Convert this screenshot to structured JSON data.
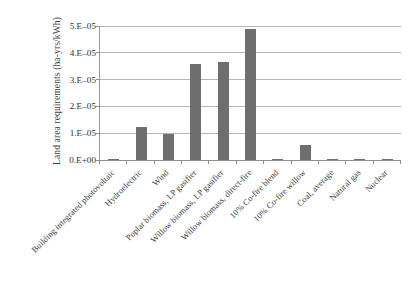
{
  "chart_data": {
    "type": "bar",
    "title": "",
    "xlabel": "",
    "ylabel": "Land area requirements (ha-yrs/kWh)",
    "categories": [
      "Building integrated photovoltaic",
      "Hydroelectric",
      "Wind",
      "Poplar biomass, LP gasifier",
      "Willow biomass, LP gasifier",
      "Willow biomass, direct-fire",
      "10% Co-fire blend",
      "10% Co-fire willow",
      "Coal, average",
      "Natural gas",
      "Nuclear"
    ],
    "values": [
      1.5e-07,
      1.22e-05,
      9.6e-06,
      3.6e-05,
      3.64e-05,
      4.87e-05,
      2.2e-07,
      5.5e-06,
      2.3e-07,
      4e-08,
      4e-07
    ],
    "ylim": [
      0,
      5e-05
    ],
    "ytick_values": [
      0,
      1e-05,
      2e-05,
      3e-05,
      4e-05,
      5e-05
    ],
    "ytick_labels": [
      "0.E+00",
      "1.E–05",
      "2.E–05",
      "3.E–05",
      "4.E–05",
      "5.E–05"
    ],
    "grid": true,
    "legend": false,
    "legend_position": "none",
    "series_color": "#6e6e6e",
    "gridline_color": "#b6b6b6",
    "axis_color": "#8f8f8f",
    "background_color": "#ffffff"
  }
}
